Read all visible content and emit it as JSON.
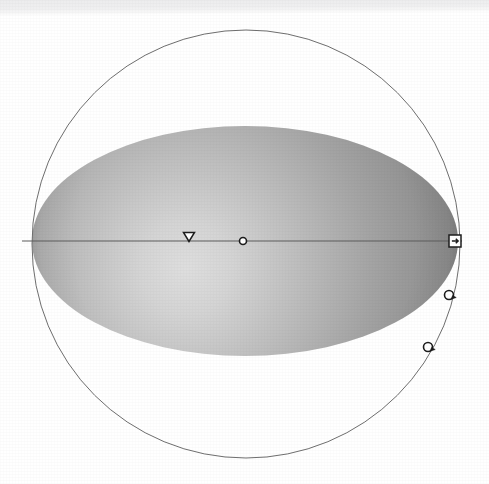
{
  "canvas": {
    "width": 489,
    "height": 484,
    "background_color": "#ffffff",
    "scan_band_color": "#ececed",
    "title": "Sphere manipulator gizmo"
  },
  "scene": {
    "outer_sphere": {
      "name": "outer-sphere-outline",
      "center_x": 246,
      "center_y": 244,
      "radius": 214,
      "stroke_color": "#6e6e6e",
      "stroke_width": 1,
      "fill": "none"
    },
    "shaded_ellipse": {
      "name": "shaded-ellipse-body",
      "center_x": 245,
      "center_y": 241,
      "radius_x": 213,
      "radius_y": 115,
      "highlight_x": 186,
      "highlight_y": 268,
      "highlight_color": "#dcdcdc",
      "mid_color": "#a9a9a9",
      "shadow_color": "#7a7a7a",
      "edge_color": "#757575"
    },
    "equator_line": {
      "name": "equator-axis-line",
      "x1": 22,
      "y1": 241,
      "x2": 462,
      "y2": 241,
      "stroke_color": "#5c5c5c",
      "stroke_width": 1
    }
  },
  "handles": [
    {
      "id": "center-pivot",
      "label": "Center pivot",
      "shape": "circle",
      "icon": "circle-handle-icon",
      "x": 243,
      "y": 241,
      "size": 7,
      "fill": "#ffffff",
      "stroke": "#1c1c1c",
      "interactable": true
    },
    {
      "id": "direction-marker",
      "label": "Direction marker",
      "shape": "triangle-down",
      "icon": "triangle-down-icon",
      "x": 189,
      "y": 237,
      "size": 11,
      "fill": "#ffffff",
      "stroke": "#1c1c1c",
      "interactable": true
    },
    {
      "id": "scale-handle",
      "label": "Scale handle",
      "shape": "square",
      "icon": "square-handle-icon",
      "x": 455,
      "y": 241,
      "size": 12,
      "fill": "#ffffff",
      "stroke": "#1c1c1c",
      "interactable": true
    },
    {
      "id": "rotate-handle-upper",
      "label": "Rotate handle upper",
      "shape": "circle-arrow",
      "icon": "circle-arrow-handle-icon",
      "x": 449,
      "y": 295,
      "size": 9,
      "fill": "#ffffff",
      "stroke": "#1c1c1c",
      "interactable": true
    },
    {
      "id": "rotate-handle-lower",
      "label": "Rotate handle lower",
      "shape": "circle-arrow",
      "icon": "circle-arrow-handle-icon",
      "x": 428,
      "y": 347,
      "size": 9,
      "fill": "#ffffff",
      "stroke": "#1c1c1c",
      "interactable": true
    }
  ]
}
